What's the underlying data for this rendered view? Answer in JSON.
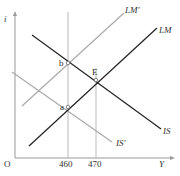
{
  "diagram": {
    "type": "IS-LM model",
    "axes": {
      "x_label": "Y",
      "y_label": "i",
      "origin_label": "O"
    },
    "x_ticks": [
      "460",
      "470"
    ],
    "curves": {
      "LM": "LM",
      "LM_shifted": "LM'",
      "IS": "IS",
      "IS_shifted": "IS'"
    },
    "points": {
      "a": "a",
      "b": "b",
      "E": "E"
    },
    "colors": {
      "original_curves": "#222222",
      "shifted_curves": "#aaaaaa",
      "guides": "#bbbbbb",
      "axis": "#999999"
    }
  }
}
